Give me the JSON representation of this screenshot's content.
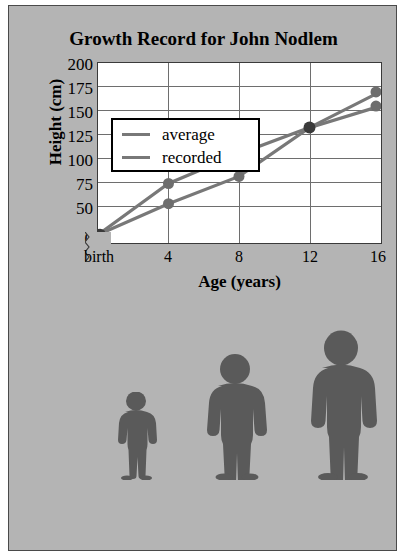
{
  "poster": {
    "background_color": "#b4b4b4",
    "border_color": "#4a4a4a"
  },
  "chart_data": {
    "type": "line",
    "title": "Growth Record for John Nodlem",
    "xlabel": "Age (years)",
    "ylabel": "Height (cm)",
    "categories": [
      "birth",
      "4",
      "8",
      "12",
      "16"
    ],
    "x": [
      0,
      4,
      8,
      12,
      16
    ],
    "xtick_labels": [
      "birth",
      "4",
      "8",
      "12",
      "16"
    ],
    "ytick_labels": [
      "200",
      "175",
      "150",
      "125",
      "100",
      "75",
      "50",
      "0"
    ],
    "ytick_values": [
      200,
      175,
      150,
      125,
      100,
      75,
      50,
      0
    ],
    "ylim": [
      50,
      200
    ],
    "y_axis_break": true,
    "grid": true,
    "legend_position": "upper-left-inside",
    "series": [
      {
        "name": "average",
        "color": "#787878",
        "marker": "circle",
        "values": [
          57,
          100,
          125,
          147,
          177
        ]
      },
      {
        "name": "recorded",
        "color": "#787878",
        "marker": "circle",
        "values": [
          57,
          83,
          106,
          147,
          165
        ]
      }
    ]
  },
  "legend": {
    "entries": [
      {
        "label": "average",
        "color": "#787878"
      },
      {
        "label": "recorded",
        "color": "#787878"
      }
    ]
  },
  "figures": {
    "caption": "",
    "color": "#5a5a5a",
    "people": [
      {
        "name": "child-small",
        "height_label": ""
      },
      {
        "name": "child-medium",
        "height_label": ""
      },
      {
        "name": "teen-tall",
        "height_label": ""
      }
    ]
  }
}
